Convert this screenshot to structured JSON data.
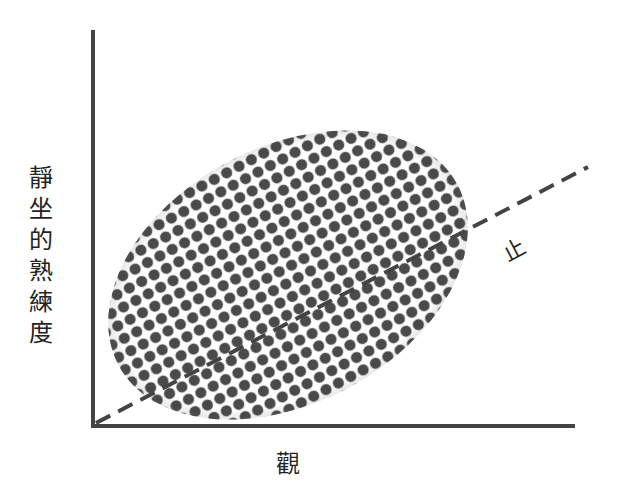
{
  "diagram": {
    "y_axis_label_chars": [
      "靜",
      "坐",
      "的",
      "熟",
      "練",
      "度"
    ],
    "x_axis_label": "觀",
    "dashed_line_label": "止",
    "colors": {
      "axis": "#444444",
      "dash": "#444444",
      "dot": "#4a4a4a",
      "background": "#ffffff"
    }
  }
}
